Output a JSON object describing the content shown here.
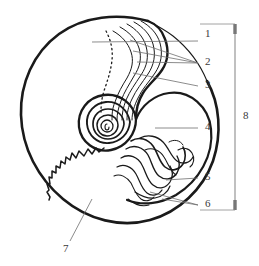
{
  "figure": {
    "background_color": "#ffffff",
    "ink_color": "#1a1a1a",
    "leader_color": "#6e6e6e",
    "label_color": "#3a3a3a",
    "bracket_color": "#8c8c8c",
    "width": 259,
    "height": 266
  },
  "labels": [
    {
      "id": "1",
      "text": "1",
      "x": 205,
      "y": 34
    },
    {
      "id": "2",
      "text": "2",
      "x": 205,
      "y": 62
    },
    {
      "id": "3",
      "text": "3",
      "x": 205,
      "y": 85
    },
    {
      "id": "4",
      "text": "4",
      "x": 205,
      "y": 127
    },
    {
      "id": "5",
      "text": "5",
      "x": 205,
      "y": 177
    },
    {
      "id": "6",
      "text": "6",
      "x": 205,
      "y": 204
    },
    {
      "id": "7",
      "text": "7",
      "x": 66,
      "y": 249
    },
    {
      "id": "8",
      "text": "8",
      "x": 242,
      "y": 116
    }
  ],
  "leaders": [
    {
      "for": "1",
      "points": "92,42 198,41"
    },
    {
      "for": "2",
      "points": "130,40 198,63"
    },
    {
      "for": "2b",
      "points": "133,50 198,63"
    },
    {
      "for": "2c",
      "points": "136,60 198,63"
    },
    {
      "for": "3",
      "points": "133,73 198,86"
    },
    {
      "for": "4",
      "points": "155,128 198,128"
    },
    {
      "for": "5",
      "points": "166,180 198,178"
    },
    {
      "for": "6",
      "points": "150,192 198,205"
    },
    {
      "for": "6b",
      "points": "160,198 198,205"
    },
    {
      "for": "7",
      "points": "92,199 70,241"
    }
  ],
  "bracket": {
    "x": 235,
    "top_y": 24,
    "bottom_y": 210,
    "cap_width": 7,
    "label_id": "8"
  },
  "parts": [
    {
      "id": "1",
      "name": "body-chamber"
    },
    {
      "id": "2",
      "name": "growth-lines"
    },
    {
      "id": "3",
      "name": "aperture-margin"
    },
    {
      "id": "4",
      "name": "inner-whorl"
    },
    {
      "id": "5",
      "name": "suture-line-complex"
    },
    {
      "id": "6",
      "name": "septal-lobes"
    },
    {
      "id": "7",
      "name": "outer-shell-wall"
    },
    {
      "id": "8",
      "name": "shell-diameter-bracket"
    }
  ]
}
